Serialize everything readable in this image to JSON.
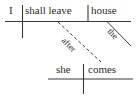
{
  "diagram": {
    "type": "reed-kellogg-sentence-diagram",
    "sentence": "I shall leave the house after she comes.",
    "ink_color": "#2b2b2b",
    "background_color": "#ffffff",
    "main_clause": {
      "subject": "I",
      "verb": "shall leave",
      "direct_object": "house",
      "object_modifier": "the"
    },
    "subordinate_clause": {
      "conjunction": "after",
      "subject": "she",
      "verb": "comes"
    },
    "lines": {
      "main_baseline": "horizontal rule under I / shall leave / house",
      "subject_verb_divider": "vertical line crossing baseline between subject and verb",
      "verb_object_divider": "short vertical line above baseline between verb and object",
      "article_slant": "diagonal line below house carrying the",
      "conjunction_slant": "dashed diagonal line from main verb down to subordinate verb carrying after",
      "sub_baseline": "horizontal rule under she / comes",
      "sub_subject_verb_divider": "vertical line crossing lower baseline between she and comes"
    }
  }
}
